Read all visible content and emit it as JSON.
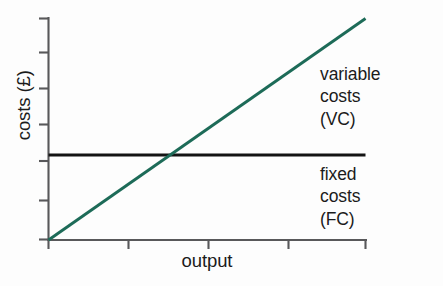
{
  "chart_data": {
    "type": "line",
    "title": "",
    "subtitle": "",
    "xlabel": "output",
    "ylabel": "costs (£)",
    "xlim": [
      0,
      4
    ],
    "ylim": [
      0,
      6
    ],
    "grid": false,
    "legend_position": "inline-right-annotations",
    "axis_ticks_labeled": false,
    "x_tick_count": 5,
    "y_tick_count": 7,
    "x_tick_values": [
      0,
      1,
      2,
      3,
      4
    ],
    "y_tick_values": [
      0,
      1,
      2,
      3,
      4,
      5,
      6
    ],
    "series": [
      {
        "name": "variable costs (VC)",
        "short_name": "VC",
        "type": "line",
        "color": "#1d6b58",
        "x": [
          0,
          4
        ],
        "values": [
          0,
          6
        ],
        "description": "straight line rising from the origin"
      },
      {
        "name": "fixed costs (FC)",
        "short_name": "FC",
        "type": "line",
        "color": "#141414",
        "x": [
          0,
          4
        ],
        "values": [
          2.3,
          2.3
        ],
        "description": "horizontal line at a constant cost level"
      }
    ],
    "annotations": [
      {
        "id": "vc",
        "lines": [
          "variable",
          "costs",
          "(VC)"
        ],
        "target_series": "variable costs (VC)"
      },
      {
        "id": "fc",
        "lines": [
          "fixed",
          "costs",
          "(FC)"
        ],
        "target_series": "fixed costs (FC)"
      }
    ],
    "colors": {
      "background": "#fdfdfd",
      "axis": "#58585a",
      "variable_costs": "#1d6b58",
      "fixed_costs": "#141414",
      "text": "#1b1b1b"
    }
  },
  "axes": {
    "y_label": "costs (£)",
    "x_label": "output"
  },
  "annotations": {
    "vc": {
      "line1": "variable",
      "line2": "costs",
      "line3": "(VC)"
    },
    "fc": {
      "line1": "fixed",
      "line2": "costs",
      "line3": "(FC)"
    }
  }
}
